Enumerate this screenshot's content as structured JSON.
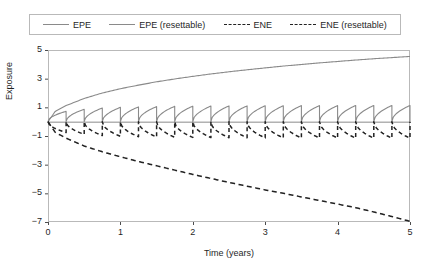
{
  "chart_data": {
    "type": "line",
    "title": "",
    "xlabel": "Time (years)",
    "ylabel": "Exposure",
    "xlim": [
      0,
      5
    ],
    "ylim": [
      -7,
      5
    ],
    "xticks": [
      "0",
      "1",
      "2",
      "3",
      "4",
      "5"
    ],
    "xtick_values": [
      0,
      1,
      2,
      3,
      4,
      5
    ],
    "yticks": [
      "5",
      "3",
      "1",
      "-1",
      "-3",
      "-5",
      "-7"
    ],
    "ytick_values": [
      5,
      3,
      1,
      -1,
      -3,
      -5,
      -7
    ],
    "grid": false,
    "legend_position": "top-outside",
    "reset_frequency_per_year": 4,
    "reset_count": 20,
    "series": [
      {
        "name": "EPE",
        "style": "solid",
        "color": "#8a8a8a",
        "x": [
          0,
          0.1,
          0.25,
          0.5,
          0.75,
          1,
          1.25,
          1.5,
          1.75,
          2,
          2.25,
          2.5,
          2.75,
          3,
          3.25,
          3.5,
          3.75,
          4,
          4.25,
          4.5,
          4.75,
          5
        ],
        "values": [
          0,
          0.72,
          1.12,
          1.62,
          2.0,
          2.3,
          2.55,
          2.78,
          2.98,
          3.16,
          3.33,
          3.48,
          3.62,
          3.75,
          3.88,
          3.99,
          4.1,
          4.2,
          4.3,
          4.39,
          4.47,
          4.55
        ]
      },
      {
        "name": "EPE (resettable)",
        "style": "solid",
        "color": "#8a8a8a",
        "peak_values": [
          0.72,
          0.86,
          0.95,
          1.0,
          1.03,
          1.05,
          1.07,
          1.08,
          1.09,
          1.1,
          1.1,
          1.11,
          1.11,
          1.12,
          1.12,
          1.12,
          1.13,
          1.13,
          1.13,
          1.13
        ],
        "reset_to": 0
      },
      {
        "name": "ENE",
        "style": "dashed",
        "color": "#222222",
        "x": [
          0,
          0.1,
          0.25,
          0.5,
          0.75,
          1,
          1.25,
          1.5,
          1.75,
          2,
          2.25,
          2.5,
          2.75,
          3,
          3.25,
          3.5,
          3.75,
          4,
          4.25,
          4.5,
          4.75,
          5
        ],
        "values": [
          0,
          -0.75,
          -1.15,
          -1.7,
          -2.1,
          -2.45,
          -2.78,
          -3.08,
          -3.38,
          -3.68,
          -3.96,
          -4.24,
          -4.5,
          -4.76,
          -5.0,
          -5.25,
          -5.5,
          -5.75,
          -6.0,
          -6.3,
          -6.62,
          -6.95
        ]
      },
      {
        "name": "ENE (resettable)",
        "style": "dashed",
        "color": "#222222",
        "peak_values": [
          -0.75,
          -0.88,
          -0.97,
          -1.02,
          -1.05,
          -1.07,
          -1.09,
          -1.1,
          -1.11,
          -1.12,
          -1.12,
          -1.13,
          -1.13,
          -1.14,
          -1.14,
          -1.14,
          -1.15,
          -1.15,
          -1.15,
          -1.15
        ],
        "reset_to": 0
      }
    ]
  },
  "legend": {
    "items": [
      {
        "label": "EPE",
        "style": "solid"
      },
      {
        "label": "EPE (resettable)",
        "style": "solid"
      },
      {
        "label": "ENE",
        "style": "dashed"
      },
      {
        "label": "ENE (resettable)",
        "style": "dashed"
      }
    ]
  },
  "axes": {
    "xlabel": "Time (years)",
    "ylabel": "Exposure"
  },
  "colors": {
    "epe": "#8a8a8a",
    "ene": "#222222",
    "frame": "#b9b9b9",
    "zero_line": "#8a8a8a",
    "text": "#1f1f1f"
  }
}
